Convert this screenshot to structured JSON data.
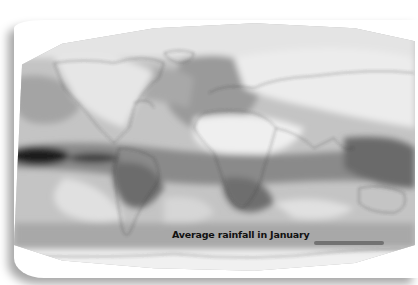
{
  "map": {
    "title": "Average rainfall in January",
    "type": "world rainfall map (grayscale)",
    "shading": {
      "darkest": "#1a1a1a",
      "dark": "#5c5c5c",
      "medium": "#8e8e8e",
      "light": "#b8b8b8",
      "lightest": "#ececec"
    }
  }
}
